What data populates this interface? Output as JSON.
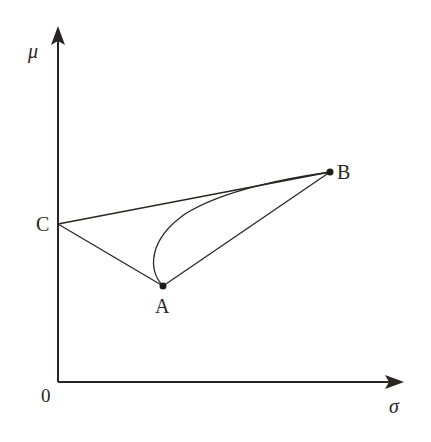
{
  "diagram": {
    "type": "mean-variance frontier",
    "axes": {
      "y_label": "μ",
      "x_label": "σ",
      "origin_label": "0"
    },
    "points": [
      {
        "id": "A",
        "label": "A"
      },
      {
        "id": "B",
        "label": "B"
      },
      {
        "id": "C",
        "label": "C"
      }
    ],
    "segments": [
      "C-B",
      "C-A",
      "A-B"
    ],
    "curves": [
      "A-B (curved frontier bulging left)"
    ],
    "colors": {
      "ink": "#2a2523",
      "background": "#ffffff"
    }
  }
}
